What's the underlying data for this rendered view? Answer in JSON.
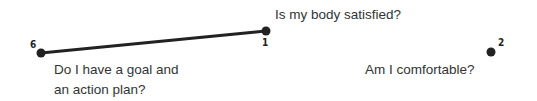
{
  "diagram": {
    "nodes": [
      {
        "id": "1",
        "label": "1",
        "x": 266,
        "y": 31
      },
      {
        "id": "2",
        "label": "2",
        "x": 491,
        "y": 52
      },
      {
        "id": "6",
        "label": "6",
        "x": 41,
        "y": 53
      }
    ],
    "edges": [
      {
        "from": "6",
        "to": "1"
      }
    ],
    "questions": {
      "body": "Is my body satisfied?",
      "goal_line1": "Do I have a goal and",
      "goal_line2": "an action plan?",
      "comfort": "Am I comfortable?"
    },
    "colors": {
      "line": "#222222",
      "node": "#222222",
      "text": "#333333"
    }
  }
}
